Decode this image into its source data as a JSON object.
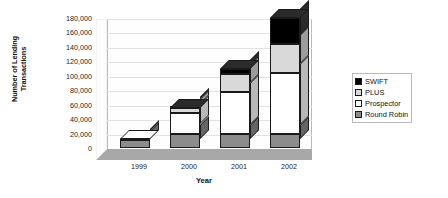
{
  "chart_data": {
    "type": "bar",
    "subtype": "stacked-column-3d",
    "title": "",
    "xlabel": "Year",
    "ylabel": "Number of Lending Transactions",
    "categories": [
      "1999",
      "2000",
      "2001",
      "2002"
    ],
    "series": [
      {
        "name": "Round Robin",
        "color": "#8c8c8c",
        "values": [
          11000,
          20000,
          20000,
          20000
        ]
      },
      {
        "name": "Prospector",
        "color": "#ffffff",
        "values": [
          2000,
          28000,
          58000,
          84000
        ]
      },
      {
        "name": "PLUS",
        "color": "#d9d9d9",
        "values": [
          0,
          7000,
          25000,
          40000
        ]
      },
      {
        "name": "SWIFT",
        "color": "#000000",
        "values": [
          0,
          1000,
          7000,
          36000
        ]
      }
    ],
    "totals": [
      13000,
      56000,
      110000,
      180000
    ],
    "ylim": [
      0,
      180000
    ],
    "yticks": [
      0,
      20000,
      40000,
      60000,
      80000,
      100000,
      120000,
      140000,
      160000,
      180000
    ],
    "ytick_labels": [
      "0",
      "20,000",
      "40,000",
      "60,000",
      "80,000",
      "100,000",
      "120,000",
      "140,000",
      "160,000",
      "180,000"
    ],
    "grid": true,
    "legend_position": "right",
    "legend_order": [
      "SWIFT",
      "PLUS",
      "Prospector",
      "Round Robin"
    ]
  },
  "axes": {
    "y_title_line1": "Number of Lending",
    "y_title_line2": "Transactions",
    "x_title": "Year"
  },
  "colors": {
    "plot_background": "#fefefe",
    "floor": "#a8a8a8",
    "side_wall": "#d0d0d0",
    "gridline": "#e2e2e2",
    "border": "#b9b9b9",
    "outline": "#1a1a1a"
  }
}
